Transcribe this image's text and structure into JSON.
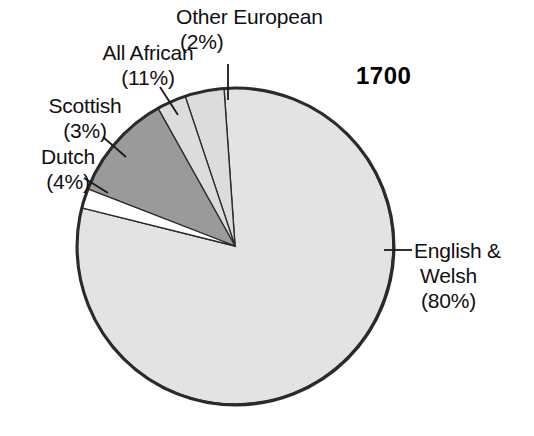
{
  "year_title": "1700",
  "chart_data": {
    "type": "pie",
    "title": "1700",
    "subtitle": "",
    "xlabel": "",
    "ylabel": "",
    "legend_position": "none",
    "grid": false,
    "units": "percent",
    "total": 100,
    "start_angle_deg": -4,
    "direction": "clockwise",
    "center": {
      "x": 235,
      "y": 246
    },
    "radius": 158,
    "categories": [
      "English & Welsh",
      "Other European",
      "All African",
      "Scottish",
      "Dutch"
    ],
    "values": [
      80,
      2,
      11,
      3,
      4
    ],
    "slices": [
      {
        "name": "english-welsh",
        "label": "English &",
        "label_line2": "Welsh",
        "percent_text": "(80%)",
        "value": 80,
        "fill": "#e3e3e3",
        "stroke": "#2b2b2b"
      },
      {
        "name": "other-european",
        "label": "Other European",
        "percent_text": "(2%)",
        "value": 2,
        "fill": "#ffffff",
        "stroke": "#2b2b2b"
      },
      {
        "name": "all-african",
        "label": "All African",
        "percent_text": "(11%)",
        "value": 11,
        "fill": "#9a9a9a",
        "stroke": "#2b2b2b"
      },
      {
        "name": "scottish",
        "label": "Scottish",
        "percent_text": "(3%)",
        "value": 3,
        "fill": "#dcdcdc",
        "stroke": "#2b2b2b"
      },
      {
        "name": "dutch",
        "label": "Dutch",
        "percent_text": "(4%)",
        "value": 4,
        "fill": "#dcdcdc",
        "stroke": "#2b2b2b"
      }
    ],
    "colors": {
      "background": "#ffffff",
      "outline": "#2b2b2b",
      "text": "#101010",
      "large_slice": "#e3e3e3",
      "african_slice": "#9a9a9a",
      "thin_slices": "#dcdcdc",
      "european_slice": "#ffffff"
    }
  },
  "labels": {
    "other_european": {
      "name": "Other European",
      "percent": "(2%)"
    },
    "all_african": {
      "name": "All African",
      "percent": "(11%)"
    },
    "scottish": {
      "name": "Scottish",
      "percent": "(3%)"
    },
    "dutch": {
      "name": "Dutch",
      "percent": "(4%)"
    },
    "english_welsh": {
      "name_line1": "English &",
      "name_line2": "Welsh",
      "percent": "(80%)"
    }
  }
}
